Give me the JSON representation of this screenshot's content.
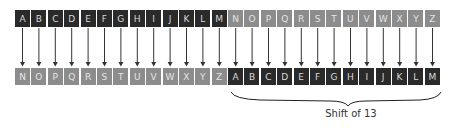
{
  "diagram": {
    "colors": {
      "first_half": "#2a2a2a",
      "second_half": "#8c8c8c",
      "letter": "#d8d8d8",
      "arrow": "#333333"
    },
    "plain_row": [
      "A",
      "B",
      "C",
      "D",
      "E",
      "F",
      "G",
      "H",
      "I",
      "J",
      "K",
      "L",
      "M",
      "N",
      "O",
      "P",
      "Q",
      "R",
      "S",
      "T",
      "U",
      "V",
      "W",
      "X",
      "Y",
      "Z"
    ],
    "plain_row_shade": [
      "dark",
      "dark",
      "dark",
      "dark",
      "dark",
      "dark",
      "dark",
      "dark",
      "dark",
      "dark",
      "dark",
      "dark",
      "dark",
      "gray",
      "gray",
      "gray",
      "gray",
      "gray",
      "gray",
      "gray",
      "gray",
      "gray",
      "gray",
      "gray",
      "gray",
      "gray"
    ],
    "cipher_row": [
      "N",
      "O",
      "P",
      "Q",
      "R",
      "S",
      "T",
      "U",
      "V",
      "W",
      "X",
      "Y",
      "Z",
      "A",
      "B",
      "C",
      "D",
      "E",
      "F",
      "G",
      "H",
      "I",
      "J",
      "K",
      "L",
      "M"
    ],
    "cipher_row_shade": [
      "gray",
      "gray",
      "gray",
      "gray",
      "gray",
      "gray",
      "gray",
      "gray",
      "gray",
      "gray",
      "gray",
      "gray",
      "gray",
      "dark",
      "dark",
      "dark",
      "dark",
      "dark",
      "dark",
      "dark",
      "dark",
      "dark",
      "dark",
      "dark",
      "dark",
      "dark"
    ],
    "arrow_count": 26,
    "brace_label": "Shift of 13"
  }
}
